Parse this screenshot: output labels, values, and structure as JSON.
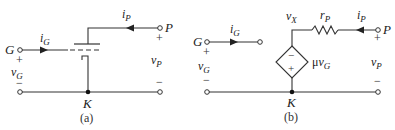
{
  "panel_a": {
    "caption": "(a)",
    "gate_terminal": "G",
    "plate_terminal": "P",
    "cathode_node": "K",
    "grid_current_base": "i",
    "grid_current_sub": "G",
    "plate_current_base": "i",
    "plate_current_sub": "P",
    "grid_voltage_base": "v",
    "grid_voltage_sub": "G",
    "plate_voltage_base": "v",
    "plate_voltage_sub": "P",
    "plus": "+",
    "minus": "−"
  },
  "panel_b": {
    "caption": "(b)",
    "gate_terminal": "G",
    "plate_terminal": "P",
    "cathode_node": "K",
    "grid_current_base": "i",
    "grid_current_sub": "G",
    "plate_current_base": "i",
    "plate_current_sub": "P",
    "grid_voltage_base": "v",
    "grid_voltage_sub": "G",
    "plate_voltage_base": "v",
    "plate_voltage_sub": "P",
    "node_voltage_base": "v",
    "node_voltage_sub": "X",
    "resistor_base": "r",
    "resistor_sub": "P",
    "source_gain": "μ",
    "source_var_base": "v",
    "source_var_sub": "G",
    "source_minus": "−",
    "source_plus": "+",
    "plus": "+",
    "minus": "−"
  }
}
